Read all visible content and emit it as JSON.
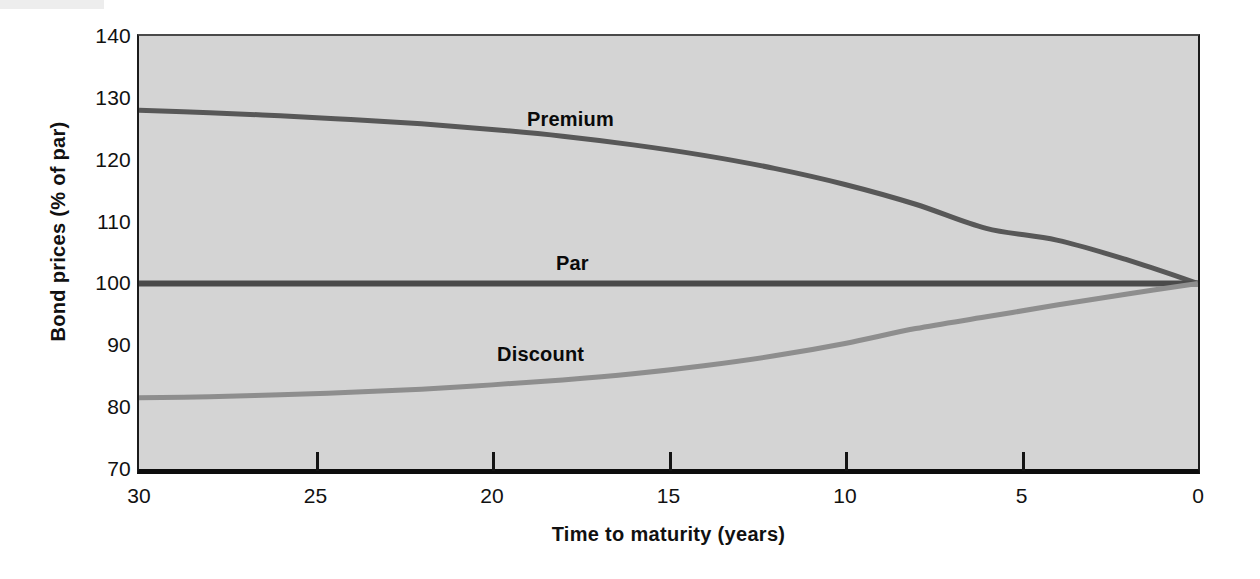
{
  "figure": {
    "background_color": "#ffffff",
    "plot_background_color": "#d4d4d4"
  },
  "chart_data": {
    "type": "line",
    "title": "",
    "xlabel": "Time to maturity (years)",
    "ylabel": "Bond prices (% of par)",
    "xlim": [
      30,
      0
    ],
    "ylim": [
      70,
      140
    ],
    "x_reversed": true,
    "grid": false,
    "legend": "none (inline curve annotations)",
    "xticks": [
      30,
      25,
      20,
      15,
      10,
      5,
      0
    ],
    "xticklabels": [
      "30",
      "25",
      "20",
      "15",
      "10",
      "5",
      "0"
    ],
    "yticks": [
      70,
      80,
      90,
      100,
      110,
      120,
      130,
      140
    ],
    "yticklabels": [
      "70",
      "80",
      "90",
      "100",
      "110",
      "120",
      "130",
      "140"
    ],
    "x": [
      30,
      28,
      26,
      24,
      22,
      20,
      18,
      16,
      14,
      12,
      10,
      8,
      6,
      4,
      2,
      0
    ],
    "series": [
      {
        "name": "Premium",
        "color": "#585858",
        "linewidth": 5,
        "annotation": "Premium",
        "values": [
          128.0,
          127.6,
          127.1,
          126.5,
          125.8,
          124.9,
          123.8,
          122.4,
          120.7,
          118.6,
          116.0,
          112.8,
          108.9,
          107.0,
          103.8,
          100.0
        ]
      },
      {
        "name": "Par",
        "color": "#4a4a4a",
        "linewidth": 6,
        "annotation": "Par",
        "values": [
          100.0,
          100.0,
          100.0,
          100.0,
          100.0,
          100.0,
          100.0,
          100.0,
          100.0,
          100.0,
          100.0,
          100.0,
          100.0,
          100.0,
          100.0,
          100.0
        ]
      },
      {
        "name": "Discount",
        "color": "#8e8e8e",
        "linewidth": 5,
        "annotation": "Discount",
        "values": [
          81.5,
          81.7,
          82.0,
          82.4,
          82.9,
          83.6,
          84.4,
          85.4,
          86.7,
          88.3,
          90.3,
          92.7,
          94.6,
          96.5,
          98.3,
          100.0
        ]
      }
    ]
  },
  "axis": {
    "y_title": "Bond prices (% of par)",
    "x_title": "Time to maturity (years)",
    "y_labels": [
      "140",
      "130",
      "120",
      "110",
      "100",
      "90",
      "80",
      "70"
    ],
    "x_labels": [
      "30",
      "25",
      "20",
      "15",
      "10",
      "5",
      "0"
    ]
  },
  "annotations": {
    "premium": "Premium",
    "par": "Par",
    "discount": "Discount"
  }
}
